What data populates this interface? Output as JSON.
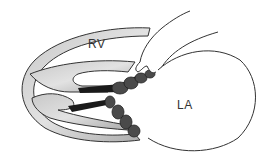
{
  "diagram": {
    "type": "anatomical-illustration",
    "labels": {
      "rv": "RV",
      "la": "LA"
    },
    "colors": {
      "background": "#ffffff",
      "outline": "#333333",
      "wall_fill": "#b5b5b5",
      "wall_light": "#d9d9d9",
      "leaflet_dark": "#1a1a1a",
      "leaflet_nodule": "#4a4a4a"
    }
  }
}
